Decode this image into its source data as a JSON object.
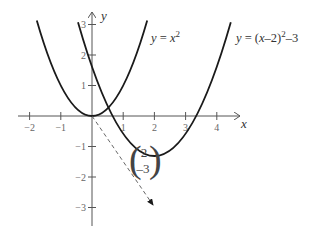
{
  "diagram": {
    "type": "coordinate-graph",
    "axes": {
      "x_label": "x",
      "y_label": "y",
      "x_ticks": [
        {
          "value": -2,
          "label": "−2"
        },
        {
          "value": -1,
          "label": "−1"
        },
        {
          "value": 1,
          "label": "1"
        },
        {
          "value": 2,
          "label": "2"
        },
        {
          "value": 3,
          "label": "3"
        },
        {
          "value": 4,
          "label": "4"
        }
      ],
      "y_ticks": [
        {
          "value": 3,
          "label": "3"
        },
        {
          "value": 2,
          "label": "2"
        },
        {
          "value": 1,
          "label": "1"
        },
        {
          "value": -1,
          "label": "−1"
        },
        {
          "value": -2,
          "label": "−2"
        },
        {
          "value": -3,
          "label": "−3"
        }
      ]
    },
    "curves": [
      {
        "name": "y = x^2",
        "label_prefix": "y = ",
        "label_var": "x",
        "label_sup": "2"
      },
      {
        "name": "y = (x-2)^2 - 3",
        "label_prefix": "y = (",
        "label_var": "x",
        "label_mid": "–2)",
        "label_sup": "2",
        "label_suffix": "–3"
      }
    ],
    "translation_vector": {
      "top": "2",
      "bottom": "–3",
      "from": [
        0,
        0
      ],
      "to": [
        2,
        -3
      ]
    },
    "colors": {
      "curve": "#1a1a1a",
      "axis": "#555555",
      "text": "#333333"
    }
  }
}
